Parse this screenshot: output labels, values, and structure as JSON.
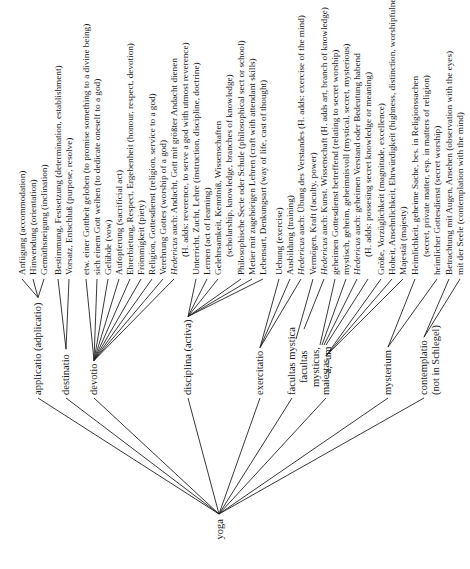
{
  "root": {
    "label": "yoga"
  },
  "branches": [
    {
      "id": "applicatio",
      "label": "applicatio (adplicatio)",
      "leaves": [
        {
          "text": "Anfügung (accommodation)"
        },
        {
          "text": "Hinwendung (orientation)"
        },
        {
          "text": "Gemüthsneigung (inclination)"
        }
      ]
    },
    {
      "id": "destinatio",
      "label": "destinatio",
      "leaves": [
        {
          "text": "Bestimmung, Festsetzung (determination, establishment)"
        },
        {
          "text": "Vorsatz, Entschluß (purpose, resolve)"
        }
      ]
    },
    {
      "id": "devotio",
      "label": "devotio",
      "leaves": [
        {
          "text": "etw. einer Gottheit geloben (to promise something to a divine being)"
        },
        {
          "text": "sich einem Gott weihen (to dedicate oneself to a god)"
        },
        {
          "text": "Gelübde (vow)"
        },
        {
          "text": "Aufopferung (sacrificial act)"
        },
        {
          "text": "Ehrerbietung, Respect, Ergebenheit (honour, respect, devotion)"
        },
        {
          "text": "Frömmigkeit (piety)"
        },
        {
          "text": "Religion, Gottesdienst (religion, service to a god)"
        },
        {
          "text": "Verehrung Gottes (worship of a god)"
        },
        {
          "italic": "Hedericus",
          "text": " auch: Andacht, Gott mit größter Andacht dienen"
        },
        {
          "text": "(H. adds: reverence, to serve a god with utmost reverence)",
          "indent": true
        }
      ]
    },
    {
      "id": "disciplina",
      "label": "disciplina (activa)",
      "leaves": [
        {
          "text": "Unterricht, Zucht, Lehre (instruction, discipline, doctrine)"
        },
        {
          "text": "Lernen (act of learning)"
        },
        {
          "text": "Gelehrsamkeit, Kenntniß, Wissenschaften"
        },
        {
          "text": "(scholarship, knowledge, branches of knowledge)",
          "indent": true
        },
        {
          "text": "Philosophische Secte oder Schule (philosophical sect or school)"
        },
        {
          "text": "Metier mit zugehörigen Lehren (craft with attendant skills)"
        },
        {
          "text": "Lebensart, Denkungsart (way of life, cast of thought)"
        }
      ]
    },
    {
      "id": "exercitatio",
      "label": "exercitatio",
      "leaves": [
        {
          "text": "Uebung (exercise)"
        },
        {
          "text": "Ausbildung (training)"
        },
        {
          "italic": "Hedericus",
          "text": " auch: Übung des Verstandes (H. adds: exercise of the mind)"
        }
      ]
    },
    {
      "id": "facultas",
      "label": "facultas mystica",
      "sublabels": [
        "facultas",
        "mysticus,",
        "-a, -um"
      ],
      "leaves": [
        {
          "text": "Vermögen, Kraft (faculty, power)"
        },
        {
          "italic": "Hedericus",
          "text": " auch: Kunst. Wissenschaft (H. adds art, branch of knowledge)"
        },
        {
          "text": "geheimen Gottesdienst betreffend (relating to secret worship)"
        },
        {
          "text": "mystisch, geheim, geheimnisvoll (mystical, secret, mysterious)"
        },
        {
          "italic": "Hedericus",
          "text": " auch: geheimen Verstand oder Bedeutung habend"
        },
        {
          "text": "(H. adds: possesing secret knowledge or meaning)",
          "indent": true
        }
      ]
    },
    {
      "id": "maiestas",
      "label": "maiestas",
      "leaves": [
        {
          "text": "Größe, Vorzüglichkeit (magnitude, excellence)"
        },
        {
          "text": "Hoheit, Ansehnlichkeit, Ehrwürdigkeit (highness, distinction, worshipfulness)"
        },
        {
          "text": "Majestät (majesty)"
        }
      ]
    },
    {
      "id": "mysterium",
      "label": "mysterium",
      "leaves": [
        {
          "text": "Heimlichkeit, geheime Sache, bes. in Religionssachen"
        },
        {
          "text": "(secret, private matter, esp. in matters of religion)",
          "indent": true
        },
        {
          "text": "heimlicher Gottesdienst (secret worship)"
        }
      ]
    },
    {
      "id": "contemplatio",
      "label": "contemplatio",
      "note": "(not in Schlegel)",
      "leaves": [
        {
          "text": "Betrachtung mit Augen, Ansehen (observation with the eyes)"
        },
        {
          "text": "mit der Seele (contemplation with the mind)"
        }
      ]
    }
  ]
}
